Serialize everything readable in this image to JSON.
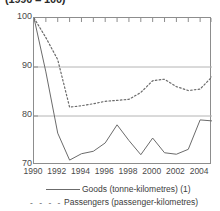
{
  "title": "(1990 = 100)",
  "axes": {
    "y_ticks": [
      "100",
      "90",
      "80",
      "70"
    ],
    "x_ticks": [
      "1990",
      "1992",
      "1994",
      "1996",
      "1998",
      "2000",
      "2002",
      "2004"
    ]
  },
  "legend": {
    "items": [
      {
        "label": "Goods (tonne-kilometres) (1)",
        "style": "solid",
        "marker": "————"
      },
      {
        "label": "Passengers (passenger-kilometres)",
        "style": "dotted",
        "marker": "- - - -"
      }
    ]
  },
  "colors": {
    "line": "#6b6b6b",
    "frame": "#8d8d8d",
    "gridline": "#b4b4b4",
    "text": "#3c3c3c"
  },
  "chart_data": {
    "type": "line",
    "title": "(1990 = 100)",
    "xlabel": "",
    "ylabel": "",
    "xlim": [
      1990,
      2005
    ],
    "ylim": [
      70,
      100
    ],
    "grid": true,
    "gridlines_y": [
      80,
      90
    ],
    "legend_position": "bottom",
    "x": [
      1990,
      1991,
      1992,
      1993,
      1994,
      1995,
      1996,
      1997,
      1998,
      1999,
      2000,
      2001,
      2002,
      2003,
      2004,
      2005
    ],
    "series": [
      {
        "name": "Goods (tonne-kilometres) (1)",
        "style": "solid",
        "values": [
          100.0,
          89.0,
          76.5,
          71.0,
          72.3,
          72.8,
          74.5,
          78.2,
          75.0,
          72.1,
          75.5,
          72.5,
          72.2,
          73.2,
          79.2,
          79.0
        ]
      },
      {
        "name": "Passengers (passenger-kilometres)",
        "style": "dotted",
        "values": [
          100.0,
          96.0,
          91.5,
          81.8,
          82.1,
          82.5,
          83.0,
          83.2,
          83.4,
          84.8,
          87.2,
          87.5,
          86.0,
          85.2,
          85.5,
          88.0
        ]
      }
    ]
  }
}
